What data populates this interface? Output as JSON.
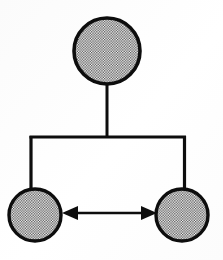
{
  "diagram": {
    "background_color": "#ffffff",
    "stroke_color": "#0d0d0d",
    "fill_pattern": "halftone-checker-gray",
    "fill_pattern_colors": {
      "light": "#ffffff",
      "dark": "#5a5a5a",
      "average": "#b0b0b0"
    },
    "canvas": {
      "width": 223,
      "height": 260
    },
    "nodes": [
      {
        "id": "parent",
        "label": "",
        "role": "parent-node",
        "shape": "circle",
        "cx": 107,
        "cy": 51,
        "r": 33,
        "stroke_width": 3.6,
        "fill": "halftone-checker-gray"
      },
      {
        "id": "child-left",
        "label": "",
        "role": "child-node-left",
        "shape": "circle",
        "cx": 35,
        "cy": 215,
        "r": 26,
        "stroke_width": 3.4,
        "fill": "halftone-checker-gray"
      },
      {
        "id": "child-right",
        "label": "",
        "role": "child-node-right",
        "shape": "circle",
        "cx": 182,
        "cy": 215,
        "r": 26,
        "stroke_width": 3.4,
        "fill": "halftone-checker-gray"
      }
    ],
    "edges": [
      {
        "id": "trunk",
        "type": "orthogonal-tree-connector",
        "from": "parent",
        "to": [
          "child-left",
          "child-right"
        ],
        "stroke_width": 3,
        "arrowheads": "none",
        "path": "M 107 84 L 107 137 M 31 137 L 185 137 M 31 137 L 31 189 M 184 137 L 184 189"
      },
      {
        "id": "sibling-link",
        "type": "bidirectional-arrow",
        "from": "child-left",
        "to": "child-right",
        "stroke_width": 2.6,
        "arrowheads": "both",
        "y": 213,
        "x_start": 62,
        "x_end": 157,
        "arrowhead_length": 16,
        "arrowhead_half_width": 7
      }
    ],
    "geometry_notes": {
      "trunk_top_y": 84,
      "crossbar_y": 137,
      "crossbar_x_left": 31,
      "crossbar_x_right": 185,
      "drop_bottom_y": 189
    }
  }
}
